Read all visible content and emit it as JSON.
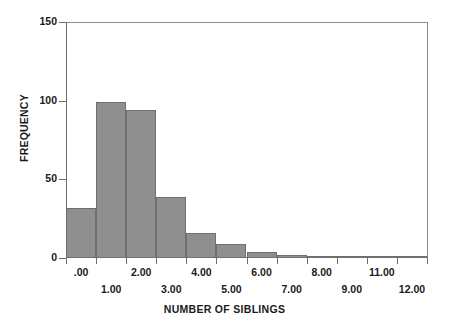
{
  "chart_data": {
    "type": "bar",
    "title": "",
    "subtitle": "",
    "xlabel": "NUMBER OF SIBLINGS",
    "ylabel": "FREQUENCY",
    "categories": [
      ".00",
      "1.00",
      "2.00",
      "3.00",
      "4.00",
      "5.00",
      "6.00",
      "7.00",
      "8.00",
      "9.00",
      "11.00",
      "12.00"
    ],
    "values": [
      32,
      99,
      94,
      39,
      16,
      9,
      4,
      2,
      1,
      1,
      1,
      1
    ],
    "ylim": [
      0,
      150
    ],
    "yticks": [
      0,
      50,
      100,
      150
    ],
    "ytick_labels": [
      "0",
      "50",
      "100",
      "150"
    ],
    "xtick_labels_row_top": [
      ".00",
      "2.00",
      "4.00",
      "6.00",
      "8.00",
      "11.00"
    ],
    "xtick_labels_row_bottom": [
      "1.00",
      "3.00",
      "5.00",
      "7.00",
      "9.00",
      "12.00"
    ],
    "grid": false,
    "legend": false,
    "legend_position": "none",
    "bar_color": "#8f8f8f",
    "bar_edge_color": "#6f6f6f",
    "axis_color": "#6d6d6d",
    "background_color": "#ffffff"
  }
}
